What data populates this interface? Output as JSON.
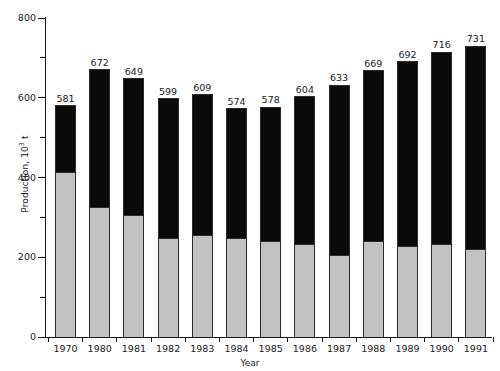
{
  "chart_data": {
    "type": "bar",
    "stacked": true,
    "title": "",
    "xlabel": "Year",
    "ylabel": "Production, 10³ t",
    "ylabel_prefix": "Production, 10",
    "ylabel_exponent": "3",
    "ylabel_suffix": " t",
    "categories": [
      "1970",
      "1980",
      "1981",
      "1982",
      "1983",
      "1984",
      "1985",
      "1986",
      "1987",
      "1988",
      "1989",
      "1990",
      "1991"
    ],
    "totals": [
      581,
      672,
      649,
      599,
      609,
      574,
      578,
      604,
      633,
      669,
      692,
      716,
      731
    ],
    "series": [
      {
        "name": "lower-segment",
        "color": "#c2c2c2",
        "values": [
          414,
          326,
          306,
          248,
          256,
          248,
          241,
          233,
          206,
          241,
          228,
          233,
          221
        ]
      },
      {
        "name": "upper-segment",
        "color": "#0a0a0a",
        "values": [
          167,
          346,
          343,
          351,
          353,
          326,
          337,
          371,
          427,
          428,
          464,
          483,
          510
        ]
      }
    ],
    "ylim": [
      0,
      800
    ],
    "ytick_labels": [
      "0",
      "200",
      "400",
      "600",
      "800"
    ],
    "ytick_values": [
      0,
      200,
      400,
      600,
      800
    ],
    "yminor_values": [
      100,
      300,
      500,
      700
    ],
    "grid": false,
    "legend": null,
    "data_labels_shown": true
  }
}
